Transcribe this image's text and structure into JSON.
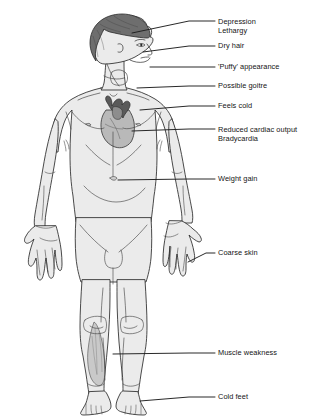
{
  "diagram": {
    "background_color": "#ffffff",
    "ink_color": "#141414",
    "skin_fill": "#ebebeb",
    "hair_fill": "#6e6e6e",
    "muscle_shade": "#c9c9c9",
    "heart_fill": "#b8b8b8",
    "heart_vessel_fill": "#5a5a5a",
    "leader_line_color": "#1d1d1d"
  },
  "labels": [
    {
      "id": "depression-lethargy",
      "lines": [
        "Depression",
        "Lethargy"
      ],
      "text_x": 218,
      "text_y": 18,
      "line_x1": 132,
      "line_y1": 33,
      "line_x2": 189,
      "line_y2": 21,
      "line_x3": 215,
      "line_y3": 21
    },
    {
      "id": "dry-hair",
      "lines": [
        "Dry hair"
      ],
      "text_x": 218,
      "text_y": 42,
      "line_x1": 143,
      "line_y1": 52,
      "line_x2": 189,
      "line_y2": 46,
      "line_x3": 215,
      "line_y3": 46
    },
    {
      "id": "puffy-appearance",
      "lines": [
        "'Puffy' appearance"
      ],
      "text_x": 218,
      "text_y": 63,
      "line_x1": 150,
      "line_y1": 67,
      "line_x2": 189,
      "line_y2": 67,
      "line_x3": 215,
      "line_y3": 67
    },
    {
      "id": "possible-goitre",
      "lines": [
        "Possible goitre"
      ],
      "text_x": 218,
      "text_y": 82,
      "line_x1": 137,
      "line_y1": 88,
      "line_x2": 189,
      "line_y2": 86,
      "line_x3": 215,
      "line_y3": 86
    },
    {
      "id": "feels-cold",
      "lines": [
        "Feels cold"
      ],
      "text_x": 218,
      "text_y": 102,
      "line_x1": 140,
      "line_y1": 110,
      "line_x2": 189,
      "line_y2": 106,
      "line_x3": 215,
      "line_y3": 106
    },
    {
      "id": "reduced-cardiac-output-bradycardia",
      "lines": [
        "Reduced cardiac output",
        "Bradycardia"
      ],
      "text_x": 218,
      "text_y": 126,
      "line_x1": 132,
      "line_y1": 131,
      "line_x2": 189,
      "line_y2": 129,
      "line_x3": 215,
      "line_y3": 129
    },
    {
      "id": "weight-gain",
      "lines": [
        "Weight gain"
      ],
      "text_x": 218,
      "text_y": 175,
      "line_x1": 118,
      "line_y1": 180,
      "line_x2": 189,
      "line_y2": 179,
      "line_x3": 215,
      "line_y3": 179
    },
    {
      "id": "coarse-skin",
      "lines": [
        "Coarse skin"
      ],
      "text_x": 218,
      "text_y": 249,
      "line_x1": 188,
      "line_y1": 262,
      "line_x2": 206,
      "line_y2": 253,
      "line_x3": 215,
      "line_y3": 253
    },
    {
      "id": "muscle-weakness",
      "lines": [
        "Muscle weakness"
      ],
      "text_x": 218,
      "text_y": 349,
      "line_x1": 113,
      "line_y1": 354,
      "line_x2": 189,
      "line_y2": 353,
      "line_x3": 215,
      "line_y3": 353
    },
    {
      "id": "cold-feet",
      "lines": [
        "Cold feet"
      ],
      "text_x": 218,
      "text_y": 393,
      "line_x1": 140,
      "line_y1": 401,
      "line_x2": 189,
      "line_y2": 397,
      "line_x3": 215,
      "line_y3": 397
    }
  ],
  "body_parts": [
    {
      "id": "head-profile",
      "name": "head"
    },
    {
      "id": "hair",
      "name": "hair"
    },
    {
      "id": "neck",
      "name": "neck"
    },
    {
      "id": "torso",
      "name": "torso"
    },
    {
      "id": "heart",
      "name": "heart"
    },
    {
      "id": "left-arm",
      "name": "left-arm"
    },
    {
      "id": "right-arm",
      "name": "right-arm"
    },
    {
      "id": "left-hand",
      "name": "left-hand"
    },
    {
      "id": "right-hand",
      "name": "right-hand"
    },
    {
      "id": "left-leg",
      "name": "left-leg"
    },
    {
      "id": "right-leg",
      "name": "right-leg"
    },
    {
      "id": "calf-muscle-shading",
      "name": "calf-muscle"
    },
    {
      "id": "left-foot",
      "name": "left-foot"
    },
    {
      "id": "right-foot",
      "name": "right-foot"
    }
  ]
}
